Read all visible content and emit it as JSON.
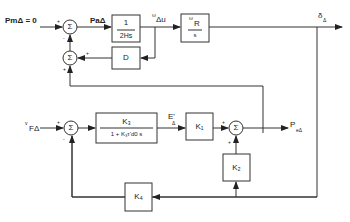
{
  "diagram": {
    "type": "block-diagram",
    "title": "",
    "inputs": {
      "pm": "PmΔ = 0",
      "vf": "v",
      "vf_sub": "FΔ"
    },
    "signals": {
      "pa": "PaΔ",
      "omega_du_sup": "ω",
      "omega_du": "Δu",
      "delta": "δ",
      "delta_sub": "Δ",
      "eq": "E'",
      "eq_sub": "Δ",
      "pe": "P",
      "pe_sub": "eΔ"
    },
    "blocks": {
      "inertia": {
        "num": "1",
        "den": "2Hs"
      },
      "damping": {
        "label": "D"
      },
      "integrator": {
        "num_sup": "ω",
        "num": "R",
        "den": "s"
      },
      "field": {
        "num": "K₃",
        "den": "1 + K₃τ'd0 s"
      },
      "k1": {
        "label": "K₁"
      },
      "k2": {
        "label": "K₂"
      },
      "k4": {
        "label": "K₄"
      }
    },
    "summers": {
      "symbol": "Σ",
      "s1_signs": [
        "+",
        "-"
      ],
      "s2_signs": [
        "+",
        "+"
      ],
      "s3_signs": [
        "+",
        "-"
      ],
      "s4_signs": [
        "+",
        "+"
      ]
    }
  }
}
